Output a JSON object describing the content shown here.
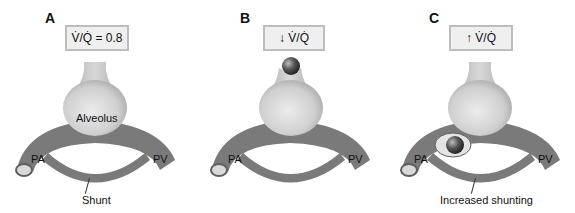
{
  "figure": {
    "colors": {
      "vessel": "#7a7a7a",
      "vessel_dark": "#5e5e5e",
      "vessel_lumen": "#d9d9d9",
      "alveolus_light": "#e6e6e6",
      "alveolus_dark": "#a9a9a9",
      "box_border": "#bdbdbd",
      "box_fill": "#efefef",
      "obstruction": "#4a4a4a"
    },
    "panels": [
      {
        "letter": "A",
        "ratio_label": "V̇/Q̇ = 0.8",
        "alveolus_label": "Alveolus",
        "pa_label": "PA",
        "pv_label": "PV",
        "callout_label": "Shunt",
        "obstruction": "none"
      },
      {
        "letter": "B",
        "ratio_label": "↓ V̇/Q̇",
        "alveolus_label": "",
        "pa_label": "PA",
        "pv_label": "PV",
        "callout_label": "",
        "obstruction": "airway"
      },
      {
        "letter": "C",
        "ratio_label": "↑ V̇/Q̇",
        "alveolus_label": "",
        "pa_label": "PA",
        "pv_label": "PV",
        "callout_label": "Increased shunting",
        "obstruction": "vessel"
      }
    ]
  }
}
